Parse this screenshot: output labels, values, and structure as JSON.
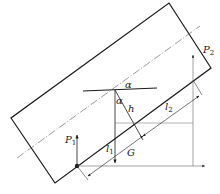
{
  "diagram": {
    "type": "force-diagram",
    "labels": {
      "alpha_top": "α",
      "alpha_vertical": "α",
      "h": "h",
      "P1": "P",
      "P1_sub": "1",
      "P2": "P",
      "P2_sub": "2",
      "l1": "l",
      "l1_sub": "1",
      "l2": "l",
      "l2_sub": "2",
      "G": "G"
    },
    "colors": {
      "line": "#1a1a1a",
      "thin_line": "#555555",
      "background": "#ffffff"
    }
  }
}
